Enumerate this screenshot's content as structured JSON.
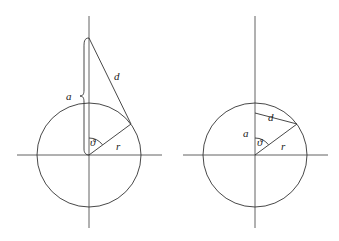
{
  "diagrams": [
    {
      "id": "left",
      "description": "Point at height a above circle center; distance d to point on circle",
      "labels": {
        "a": "a",
        "d": "d",
        "theta": "ϑ",
        "r": "r"
      },
      "center": [
        89,
        155
      ],
      "radius": 52
    },
    {
      "id": "right",
      "description": "Point at height a inside circle; chord d to point on circle",
      "labels": {
        "a": "a",
        "d": "d",
        "theta": "ϑ",
        "r": "r"
      },
      "center": [
        255,
        155
      ],
      "radius": 52
    }
  ],
  "colors": {
    "stroke": "#333333",
    "background": "#ffffff"
  }
}
